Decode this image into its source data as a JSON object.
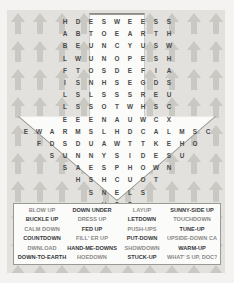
{
  "puzzle": {
    "title": "Up and Down Word Search",
    "theme_icon": "up-arrow-shape",
    "colors": {
      "page_background": "#f4f3f1",
      "pattern_background": "#e2e1dd",
      "pattern_arrow": "#c9c8c2",
      "grid_panel": "#fbfbfa",
      "grid_border": "#9a9a95",
      "letter": "#4a4a48",
      "word_dark": "#38383a",
      "word_light": "#8a8a88"
    },
    "grid": {
      "rows": [
        [
          "H",
          "D",
          "E",
          "S",
          "W",
          "E",
          "E",
          "S",
          "S"
        ],
        [
          "A",
          "B",
          "T",
          "O",
          "E",
          "A",
          "R",
          "T",
          "H"
        ],
        [
          "B",
          "E",
          "U",
          "N",
          "C",
          "Y",
          "U",
          "S",
          "W"
        ],
        [
          "L",
          "W",
          "U",
          "N",
          "O",
          "P",
          "E",
          "S",
          "H"
        ],
        [
          "F",
          "T",
          "O",
          "S",
          "D",
          "E",
          "F",
          "I",
          "A"
        ],
        [
          "I",
          "S",
          "N",
          "H",
          "S",
          "E",
          "G",
          "D",
          "S"
        ],
        [
          "L",
          "S",
          "L",
          "S",
          "S",
          "S",
          "R",
          "E",
          "U"
        ],
        [
          "L",
          "S",
          "S",
          "O",
          "T",
          "W",
          "H",
          "S",
          "C"
        ],
        [
          "E",
          "E",
          "E",
          "N",
          "A",
          "U",
          "W",
          "C",
          "X"
        ],
        [
          "E",
          "W",
          "A",
          "R",
          "M",
          "S",
          "L",
          "H",
          "D",
          "C",
          "A",
          "L",
          "M",
          "S",
          "C"
        ],
        [
          "F",
          "D",
          "S",
          "D",
          "U",
          "A",
          "W",
          "T",
          "T",
          "K",
          "E",
          "H",
          "O"
        ],
        [
          "S",
          "U",
          "N",
          "N",
          "Y",
          "S",
          "I",
          "D",
          "E",
          "S",
          "U"
        ],
        [
          "S",
          "A",
          "E",
          "S",
          "P",
          "H",
          "O",
          "W",
          "N"
        ],
        [
          "H",
          "S",
          "H",
          "C",
          "U",
          "O",
          "T"
        ],
        [
          "S",
          "N",
          "E",
          "L",
          "S"
        ],
        [
          "U",
          "S",
          "S"
        ],
        [
          "P"
        ]
      ]
    },
    "word_list": {
      "rows": [
        [
          {
            "text": "BLOW UP",
            "emphasis": "light"
          },
          {
            "text": "DOWN UNDER",
            "emphasis": "dark"
          },
          {
            "text": "LAYUP",
            "emphasis": "light"
          },
          {
            "text": "SUNNY-SIDE UP",
            "emphasis": "dark"
          }
        ],
        [
          {
            "text": "BUCKLE UP",
            "emphasis": "dark"
          },
          {
            "text": "DRESS UP",
            "emphasis": "light"
          },
          {
            "text": "LETDOWN",
            "emphasis": "dark"
          },
          {
            "text": "TOUCHDOWN",
            "emphasis": "light"
          }
        ],
        [
          {
            "text": "CALM DOWN",
            "emphasis": "light"
          },
          {
            "text": "FED UP",
            "emphasis": "dark"
          },
          {
            "text": "PUSH-UPS",
            "emphasis": "light"
          },
          {
            "text": "TUNE-UP",
            "emphasis": "dark"
          }
        ],
        [
          {
            "text": "COUNTDOWN",
            "emphasis": "dark"
          },
          {
            "text": "FILL' ER UP",
            "emphasis": "light"
          },
          {
            "text": "PUT-DOWN",
            "emphasis": "dark"
          },
          {
            "text": "UPSIDE-DOWN CAKE",
            "emphasis": "light"
          }
        ],
        [
          {
            "text": "DWNLOAD",
            "emphasis": "light"
          },
          {
            "text": "HAND-ME-DOWNS",
            "emphasis": "dark"
          },
          {
            "text": "SHOWDOWN",
            "emphasis": "light"
          },
          {
            "text": "WARM-UP",
            "emphasis": "dark"
          }
        ],
        [
          {
            "text": "DOWN-TO-EARTH",
            "emphasis": "dark"
          },
          {
            "text": "HOEDOWN",
            "emphasis": "light"
          },
          {
            "text": "STUCK-UP",
            "emphasis": "dark"
          },
          {
            "text": "WHAT' S UP, DOC?",
            "emphasis": "light"
          }
        ]
      ]
    }
  }
}
